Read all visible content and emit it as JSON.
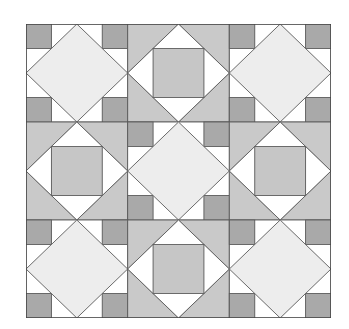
{
  "figure": {
    "title": "",
    "grid": {
      "rows": 3,
      "cols": 3
    },
    "layout": [
      [
        "A",
        "B",
        "A"
      ],
      [
        "B",
        "A",
        "B"
      ],
      [
        "A",
        "B",
        "A"
      ]
    ],
    "block_types": {
      "A": {
        "name": "Light diamond with dark corner squares",
        "diamond_fill": "#ededed",
        "corner_square_fill": "#a9a9a9",
        "triangle_fill": "#ffffff"
      },
      "B": {
        "name": "Gray corners with white triangles around center square",
        "corner_fill": "#c9c9c9",
        "triangle_fill": "#ffffff",
        "center_square_fill": "#c6c6c6"
      }
    },
    "colors": {
      "background": "#ffffff",
      "outline": "#5a5a5a"
    }
  }
}
